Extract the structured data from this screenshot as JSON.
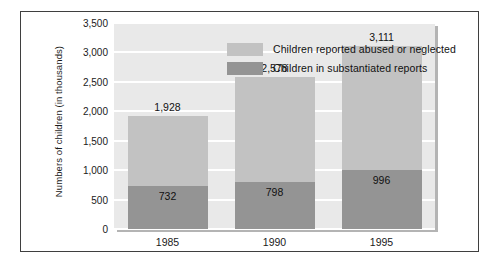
{
  "chart_data": {
    "type": "bar",
    "subtype": "stacked",
    "title": "",
    "xlabel": "",
    "ylabel": "Numbers of children (in thousands)",
    "categories": [
      "1985",
      "1990",
      "1995"
    ],
    "ylim": [
      0,
      3500
    ],
    "yticks": [
      0,
      500,
      1000,
      1500,
      2000,
      2500,
      3000,
      3500
    ],
    "ytick_labels": [
      "0",
      "500",
      "1,000",
      "1,500",
      "2,000",
      "2,500",
      "3,000",
      "3,500"
    ],
    "grid": true,
    "legend_position": "top-left-inside",
    "series": [
      {
        "name": "Children reported abused or neglected",
        "color": "#c2c2c2",
        "values": [
          1928,
          2578,
          3111
        ],
        "value_labels": [
          "1,928",
          "2,578",
          "3,111"
        ]
      },
      {
        "name": "Children in substantiated reports",
        "color": "#949494",
        "values": [
          732,
          798,
          996
        ],
        "value_labels": [
          "732",
          "798",
          "996"
        ]
      }
    ]
  },
  "colors": {
    "plot_background": "#e9e9e9",
    "gridline": "#ffffff",
    "frame_border": "#3f3f3f",
    "series_light": "#c2c2c2",
    "series_dark": "#949494",
    "text": "#1a1a1a"
  }
}
